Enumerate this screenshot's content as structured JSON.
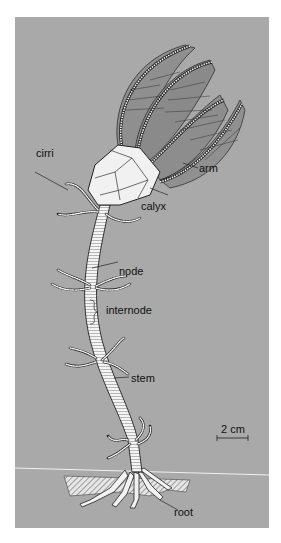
{
  "figure": {
    "background_color": "#a9a9a9",
    "labels": {
      "cirri": "cirri",
      "arm": "arm",
      "calyx": "calyx",
      "node": "node",
      "internode": "internode",
      "stem": "stem",
      "root": "root"
    },
    "scale_bar": {
      "label": "2 cm"
    }
  }
}
